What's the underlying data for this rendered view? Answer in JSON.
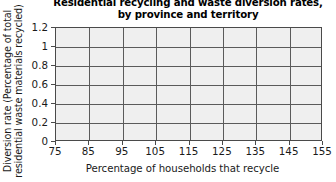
{
  "chart_data": {
    "type": "scatter",
    "title": "Residential recycling and waste diversion rates,\nby province and territory",
    "title_lines": [
      "Residential recycling and waste diversion rates,",
      "by province and territory"
    ],
    "xlabel": "Percentage of households that recycle",
    "ylabel": "Diversion rate (Percentage of total residential waste materials recycled)",
    "ylabel_lines": [
      "Diversion rate (Percentage of total",
      "residential waste materials recycled)"
    ],
    "x_ticks": [
      75,
      85,
      95,
      105,
      115,
      125,
      135,
      145,
      155
    ],
    "x_tick_labels": [
      "75",
      "85",
      "95",
      "105",
      "115",
      "125",
      "135",
      "145",
      "155"
    ],
    "y_ticks": [
      0,
      0.2,
      0.4,
      0.6,
      0.8,
      1,
      1.2
    ],
    "y_tick_labels": [
      "0",
      "0.2",
      "0.4",
      "0.6",
      "0.8",
      "1",
      "1.2"
    ],
    "xlim": [
      75,
      155
    ],
    "ylim": [
      0,
      1.2
    ],
    "series": [],
    "values": [],
    "categories": [],
    "grid": true,
    "legend": false,
    "legend_position": "none",
    "plot_background": "#efefef",
    "grid_color": "#5a5a5a",
    "axis_color": "#4a4a4a",
    "text_color": "#1a1a1a",
    "note": "Empty plotting grid; no data points or series are drawn."
  }
}
